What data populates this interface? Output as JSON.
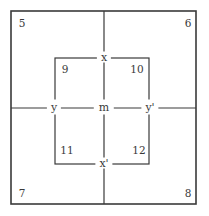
{
  "diagram": {
    "outer_box": {
      "x1": 11,
      "y1": 11,
      "x2": 196,
      "y2": 204
    },
    "inner_box": {
      "x1": 55,
      "y1": 58,
      "x2": 149,
      "y2": 164
    },
    "center": {
      "x": 104,
      "y": 108
    },
    "line_color": "#3a3a3a",
    "corner_labels": {
      "top_left": "5",
      "top_right": "6",
      "bottom_left": "7",
      "bottom_right": "8"
    },
    "inner_corner_labels": {
      "top_left": "9",
      "top_right": "10",
      "bottom_left": "11",
      "bottom_right": "12"
    },
    "axis_labels": {
      "top": "x",
      "bottom": "x'",
      "left": "y",
      "right": "y'",
      "center": "m"
    }
  }
}
